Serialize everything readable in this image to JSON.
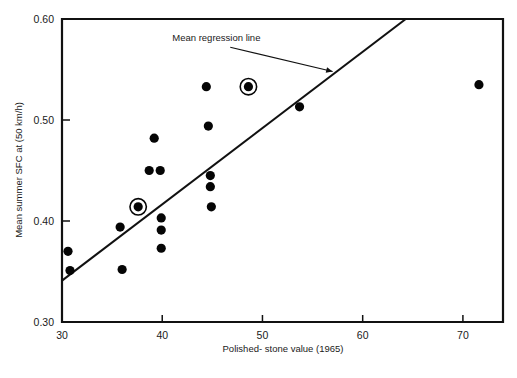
{
  "chart_data": {
    "type": "scatter",
    "title": "",
    "xlabel": "Polished- stone value (1965)",
    "ylabel": "Mean summer SFC at (50 km/h)",
    "xlim": [
      30,
      74
    ],
    "ylim": [
      0.3,
      0.6
    ],
    "xticks": [
      30,
      40,
      50,
      60,
      70
    ],
    "xticklabels": [
      "30",
      "40",
      "50",
      "60",
      "70"
    ],
    "yticks": [
      0.3,
      0.4,
      0.5,
      0.6
    ],
    "yticklabels": [
      "0.30",
      "0.40",
      "0.50",
      "0.60"
    ],
    "grid": false,
    "legend": false,
    "marker": "filled-circle",
    "points": [
      {
        "x": 30.6,
        "y": 0.37,
        "highlighted": false
      },
      {
        "x": 30.8,
        "y": 0.351,
        "highlighted": false
      },
      {
        "x": 35.8,
        "y": 0.394,
        "highlighted": false
      },
      {
        "x": 36.0,
        "y": 0.352,
        "highlighted": false
      },
      {
        "x": 37.6,
        "y": 0.414,
        "highlighted": true
      },
      {
        "x": 38.7,
        "y": 0.45,
        "highlighted": false
      },
      {
        "x": 39.2,
        "y": 0.482,
        "highlighted": false
      },
      {
        "x": 39.8,
        "y": 0.45,
        "highlighted": false
      },
      {
        "x": 39.9,
        "y": 0.403,
        "highlighted": false
      },
      {
        "x": 39.9,
        "y": 0.391,
        "handled": false,
        "highlighted": false
      },
      {
        "x": 39.9,
        "y": 0.373,
        "highlighted": false
      },
      {
        "x": 44.4,
        "y": 0.533,
        "highlighted": false
      },
      {
        "x": 44.6,
        "y": 0.494,
        "highlighted": false
      },
      {
        "x": 44.8,
        "y": 0.445,
        "highlighted": false
      },
      {
        "x": 44.8,
        "y": 0.434,
        "highlighted": false
      },
      {
        "x": 44.9,
        "y": 0.414,
        "highlighted": false
      },
      {
        "x": 48.6,
        "y": 0.533,
        "highlighted": true
      },
      {
        "x": 53.7,
        "y": 0.513,
        "highlighted": false
      },
      {
        "x": 71.6,
        "y": 0.535,
        "highlighted": false
      }
    ],
    "regression_line": {
      "label": "Mean regression line",
      "x_start": 30.0,
      "y_start": 0.341,
      "x_end": 64.3,
      "y_end": 0.6
    },
    "annotations": [
      {
        "text": "Mean regression line",
        "text_x": 41.0,
        "text_y": 0.578,
        "arrow_to_x": 57.0,
        "arrow_to_y": 0.548
      }
    ],
    "colors": {
      "marker": "#050505",
      "line": "#111111",
      "axis": "#111111",
      "text": "#1a1a1a",
      "background": "#ffffff"
    }
  }
}
